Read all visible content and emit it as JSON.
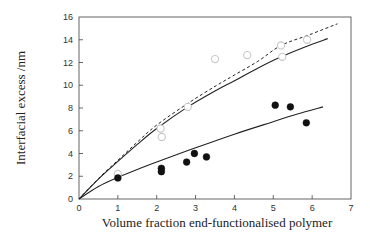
{
  "chart_data": {
    "type": "scatter",
    "title": "",
    "xlabel": "Volume fraction end-functionalised polymer",
    "ylabel": "Interfacial excess /nm",
    "xlim": [
      0,
      7
    ],
    "ylim": [
      0,
      16
    ],
    "xticks": [
      0,
      1,
      2,
      3,
      4,
      5,
      6,
      7
    ],
    "yticks": [
      0,
      2,
      4,
      6,
      8,
      10,
      12,
      14,
      16
    ],
    "xtick_labels": [
      "0",
      "1",
      "2",
      "3",
      "4",
      "5",
      "6",
      "7"
    ],
    "ytick_labels": [
      "0",
      "2",
      "4",
      "6",
      "8",
      "10",
      "12",
      "14",
      "16"
    ],
    "grid": false,
    "legend": null,
    "series": [
      {
        "name": "open circles",
        "kind": "scatter",
        "marker": "open-circle",
        "color": "#c8c8c8",
        "x": [
          1.0,
          2.1,
          2.13,
          2.8,
          3.5,
          4.33,
          5.2,
          5.23,
          5.87
        ],
        "y": [
          2.2,
          6.2,
          5.45,
          8.1,
          12.3,
          12.65,
          13.5,
          12.5,
          14.0
        ]
      },
      {
        "name": "filled circles",
        "kind": "scatter",
        "marker": "filled-circle",
        "color": "#111111",
        "x": [
          1.0,
          2.12,
          2.12,
          2.77,
          2.97,
          3.28,
          5.05,
          5.44,
          5.85
        ],
        "y": [
          1.85,
          2.7,
          2.4,
          3.25,
          4.0,
          3.7,
          8.25,
          8.1,
          6.7
        ]
      },
      {
        "name": "upper solid fit",
        "kind": "line",
        "style": "solid",
        "color": "#222222",
        "x": [
          0,
          0.5,
          1,
          1.5,
          2,
          2.8,
          3.5,
          4,
          4.6,
          5.2,
          5.8,
          6.4
        ],
        "y": [
          0,
          1.75,
          3.3,
          4.8,
          6.2,
          8.1,
          9.5,
          10.4,
          11.5,
          12.5,
          13.35,
          14.1
        ]
      },
      {
        "name": "upper dashed fit",
        "kind": "line",
        "style": "dashed",
        "color": "#222222",
        "x": [
          0,
          0.5,
          1,
          1.5,
          2,
          2.8,
          3.5,
          4,
          4.6,
          5.2,
          5.9,
          6.65
        ],
        "y": [
          0,
          1.8,
          3.4,
          5.0,
          6.5,
          8.4,
          9.9,
          10.9,
          12.1,
          13.5,
          14.4,
          15.4
        ]
      },
      {
        "name": "lower solid fit",
        "kind": "line",
        "style": "solid",
        "color": "#222222",
        "x": [
          0,
          0.5,
          1,
          1.5,
          2,
          3,
          4,
          5,
          5.6,
          6.28
        ],
        "y": [
          0,
          1.1,
          1.9,
          2.6,
          3.25,
          4.5,
          5.7,
          6.8,
          7.45,
          8.1
        ]
      }
    ]
  },
  "plot_area": {
    "left": 79,
    "top": 17,
    "right": 351,
    "bottom": 199
  }
}
